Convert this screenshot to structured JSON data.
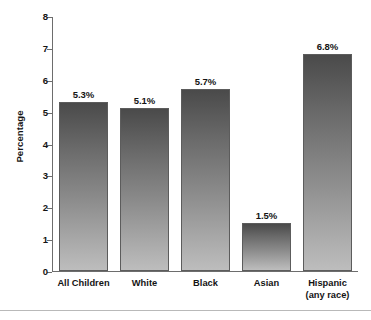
{
  "chart_data": {
    "type": "bar",
    "title": "",
    "subtitle": "",
    "xlabel": "",
    "ylabel": "Percentage",
    "ylim": [
      0,
      8
    ],
    "ytick_step": 1,
    "yticks": [
      "8",
      "7",
      "6",
      "5",
      "4",
      "3",
      "2",
      "1",
      "0"
    ],
    "grid": false,
    "legend": null,
    "categories": [
      "All Children",
      "White",
      "Black",
      "Asian",
      "Hispanic"
    ],
    "category_sublabels": [
      "",
      "",
      "",
      "",
      "(any race)"
    ],
    "values": [
      5.3,
      5.1,
      5.7,
      1.5,
      6.8
    ],
    "data_labels": [
      "5.3%",
      "5.1%",
      "5.7%",
      "1.5%",
      "6.8%"
    ],
    "units": "percent",
    "colors": {
      "bar_top": "#4a4a4a",
      "bar_bottom": "#bdbdbd",
      "bar_outline": "#5c5c5c",
      "axis": "#6d6d6d",
      "text": "#141414",
      "background": "#ffffff",
      "rule": "#b9b9b9"
    }
  }
}
